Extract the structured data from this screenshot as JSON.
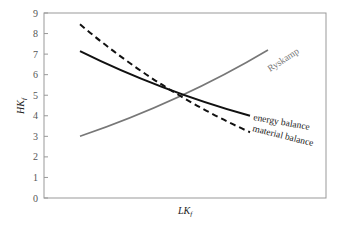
{
  "chart_data": {
    "type": "line",
    "title": "",
    "xlabel": "LK_f",
    "ylabel": "HK_f",
    "ylim": [
      0,
      9
    ],
    "yticks": [
      "0",
      "1",
      "2",
      "3",
      "4",
      "5",
      "6",
      "7",
      "8",
      "9"
    ],
    "grid": false,
    "legend": "inline annotations at line ends",
    "series": [
      {
        "name": "Ryskamp",
        "style": "solid gray",
        "color": "#777777",
        "x": [
          0,
          0.5,
          1
        ],
        "values": [
          3.0,
          5.0,
          7.2
        ]
      },
      {
        "name": "energy balance",
        "style": "solid black",
        "color": "#111111",
        "x": [
          0,
          0.5,
          1
        ],
        "values": [
          7.15,
          5.05,
          4.0
        ]
      },
      {
        "name": "material balance",
        "style": "dashed black",
        "color": "#111111",
        "x": [
          0,
          0.5,
          1
        ],
        "values": [
          8.45,
          5.0,
          3.2
        ]
      }
    ],
    "intersection": {
      "y": 5.0
    }
  },
  "labels": {
    "ylabel_main": "HK",
    "ylabel_sub": "f",
    "xlabel_main": "LK",
    "xlabel_sub": "f",
    "ryskamp": "Ryskamp",
    "energy": "energy balance",
    "material": "material balance"
  }
}
